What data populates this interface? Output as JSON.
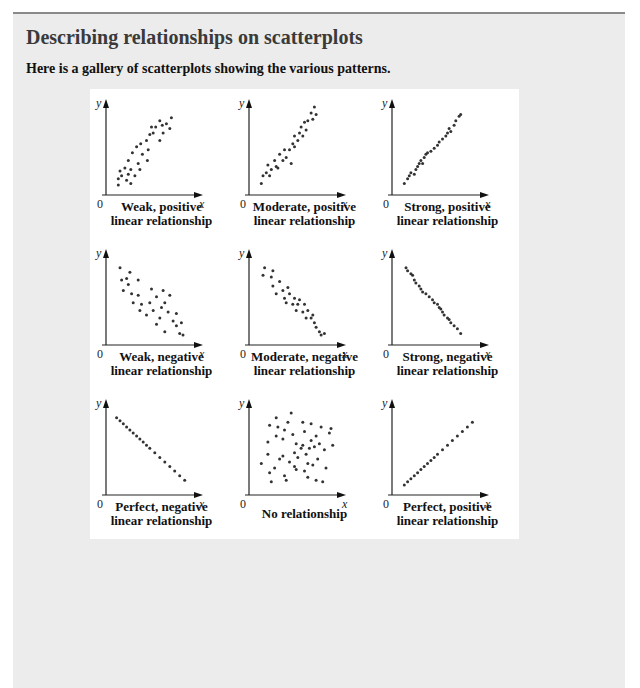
{
  "header": {
    "section_title": "Describing relationships on scatterplots",
    "intro": "Here is a gallery of scatterplots showing the various patterns."
  },
  "colors": {
    "panel_background": "#ececec",
    "gallery_background": "#ffffff",
    "point_color": "#333333",
    "top_rule": "#8a8a8a"
  },
  "axes": {
    "x_label": "x",
    "y_label": "y",
    "origin_label": "0"
  },
  "plots": [
    {
      "id": "weak-positive",
      "caption": [
        "Weak, positive",
        "linear relationship"
      ]
    },
    {
      "id": "moderate-positive",
      "caption": [
        "Moderate, positive",
        "linear relationship"
      ]
    },
    {
      "id": "strong-positive",
      "caption": [
        "Strong, positive",
        "linear relationship"
      ]
    },
    {
      "id": "weak-negative",
      "caption": [
        "Weak, negative",
        "linear relationship"
      ]
    },
    {
      "id": "moderate-negative",
      "caption": [
        "Moderate, negative",
        "linear relationship"
      ]
    },
    {
      "id": "strong-negative",
      "caption": [
        "Strong, negative",
        "linear relationship"
      ]
    },
    {
      "id": "perfect-negative",
      "caption": [
        "Perfect, negative",
        "linear relationship"
      ]
    },
    {
      "id": "no-relationship",
      "caption": [
        "No relationship"
      ]
    },
    {
      "id": "perfect-positive",
      "caption": [
        "Perfect, positive",
        "linear relationship"
      ]
    }
  ],
  "chart_data": [
    {
      "type": "scatter",
      "title": "Weak, positive linear relationship",
      "xlabel": "x",
      "ylabel": "y",
      "points": [
        [
          10,
          8
        ],
        [
          10,
          16
        ],
        [
          12,
          26
        ],
        [
          14,
          20
        ],
        [
          18,
          30
        ],
        [
          20,
          14
        ],
        [
          22,
          22
        ],
        [
          22,
          40
        ],
        [
          25,
          10
        ],
        [
          25,
          28
        ],
        [
          27,
          50
        ],
        [
          30,
          20
        ],
        [
          32,
          58
        ],
        [
          34,
          36
        ],
        [
          36,
          28
        ],
        [
          37,
          62
        ],
        [
          39,
          48
        ],
        [
          44,
          66
        ],
        [
          45,
          40
        ],
        [
          46,
          54
        ],
        [
          48,
          74
        ],
        [
          50,
          84
        ],
        [
          52,
          76
        ],
        [
          55,
          84
        ],
        [
          60,
          66
        ],
        [
          60,
          92
        ],
        [
          64,
          76
        ],
        [
          63,
          86
        ],
        [
          68,
          88
        ],
        [
          72,
          82
        ],
        [
          74,
          96
        ]
      ]
    },
    {
      "type": "scatter",
      "title": "Moderate, positive linear relationship",
      "xlabel": "x",
      "ylabel": "y",
      "points": [
        [
          10,
          10
        ],
        [
          12,
          20
        ],
        [
          16,
          24
        ],
        [
          18,
          34
        ],
        [
          20,
          20
        ],
        [
          22,
          28
        ],
        [
          26,
          40
        ],
        [
          28,
          32
        ],
        [
          30,
          30
        ],
        [
          32,
          48
        ],
        [
          36,
          40
        ],
        [
          38,
          54
        ],
        [
          40,
          44
        ],
        [
          44,
          54
        ],
        [
          46,
          36
        ],
        [
          48,
          62
        ],
        [
          50,
          58
        ],
        [
          50,
          72
        ],
        [
          54,
          66
        ],
        [
          56,
          76
        ],
        [
          58,
          84
        ],
        [
          60,
          72
        ],
        [
          62,
          90
        ],
        [
          64,
          80
        ],
        [
          66,
          92
        ],
        [
          70,
          102
        ],
        [
          72,
          94
        ],
        [
          76,
          100
        ],
        [
          74,
          110
        ]
      ]
    },
    {
      "type": "scatter",
      "title": "Strong, positive linear relationship",
      "xlabel": "x",
      "ylabel": "y",
      "points": [
        [
          10,
          10
        ],
        [
          14,
          16
        ],
        [
          16,
          20
        ],
        [
          18,
          24
        ],
        [
          22,
          22
        ],
        [
          24,
          28
        ],
        [
          26,
          32
        ],
        [
          28,
          36
        ],
        [
          30,
          40
        ],
        [
          32,
          36
        ],
        [
          34,
          44
        ],
        [
          36,
          48
        ],
        [
          38,
          50
        ],
        [
          42,
          52
        ],
        [
          46,
          56
        ],
        [
          50,
          60
        ],
        [
          52,
          64
        ],
        [
          56,
          68
        ],
        [
          60,
          72
        ],
        [
          62,
          76
        ],
        [
          64,
          82
        ],
        [
          66,
          78
        ],
        [
          70,
          86
        ],
        [
          72,
          92
        ],
        [
          76,
          98
        ],
        [
          78,
          100
        ]
      ]
    },
    {
      "type": "scatter",
      "title": "Weak, negative linear relationship",
      "xlabel": "x",
      "ylabel": "y",
      "points": [
        [
          12,
          96
        ],
        [
          14,
          80
        ],
        [
          16,
          66
        ],
        [
          20,
          82
        ],
        [
          22,
          74
        ],
        [
          24,
          90
        ],
        [
          26,
          62
        ],
        [
          28,
          50
        ],
        [
          34,
          60
        ],
        [
          34,
          80
        ],
        [
          36,
          40
        ],
        [
          38,
          48
        ],
        [
          44,
          34
        ],
        [
          48,
          50
        ],
        [
          50,
          68
        ],
        [
          52,
          40
        ],
        [
          56,
          58
        ],
        [
          56,
          22
        ],
        [
          60,
          30
        ],
        [
          62,
          44
        ],
        [
          64,
          66
        ],
        [
          66,
          12
        ],
        [
          66,
          50
        ],
        [
          70,
          38
        ],
        [
          72,
          60
        ],
        [
          76,
          26
        ],
        [
          80,
          20
        ],
        [
          80,
          36
        ],
        [
          84,
          10
        ],
        [
          86,
          24
        ],
        [
          88,
          8
        ]
      ]
    },
    {
      "type": "scatter",
      "title": "Moderate, negative linear relationship",
      "xlabel": "x",
      "ylabel": "y",
      "points": [
        [
          14,
          96
        ],
        [
          12,
          86
        ],
        [
          22,
          84
        ],
        [
          24,
          72
        ],
        [
          24,
          92
        ],
        [
          28,
          62
        ],
        [
          32,
          78
        ],
        [
          36,
          66
        ],
        [
          38,
          56
        ],
        [
          40,
          50
        ],
        [
          42,
          70
        ],
        [
          44,
          62
        ],
        [
          48,
          48
        ],
        [
          50,
          56
        ],
        [
          52,
          40
        ],
        [
          54,
          48
        ],
        [
          56,
          54
        ],
        [
          60,
          38
        ],
        [
          62,
          48
        ],
        [
          64,
          30
        ],
        [
          66,
          40
        ],
        [
          70,
          30
        ],
        [
          72,
          34
        ],
        [
          74,
          24
        ],
        [
          76,
          18
        ],
        [
          80,
          12
        ],
        [
          82,
          8
        ],
        [
          86,
          10
        ]
      ]
    },
    {
      "type": "scatter",
      "title": "Strong, negative linear relationship",
      "xlabel": "x",
      "ylabel": "y",
      "points": [
        [
          12,
          96
        ],
        [
          14,
          92
        ],
        [
          18,
          88
        ],
        [
          20,
          86
        ],
        [
          22,
          80
        ],
        [
          24,
          76
        ],
        [
          28,
          72
        ],
        [
          30,
          68
        ],
        [
          32,
          64
        ],
        [
          36,
          62
        ],
        [
          40,
          58
        ],
        [
          44,
          54
        ],
        [
          46,
          50
        ],
        [
          50,
          48
        ],
        [
          52,
          44
        ],
        [
          54,
          42
        ],
        [
          56,
          38
        ],
        [
          58,
          34
        ],
        [
          62,
          30
        ],
        [
          64,
          28
        ],
        [
          66,
          24
        ],
        [
          70,
          20
        ],
        [
          74,
          16
        ],
        [
          78,
          10
        ]
      ]
    },
    {
      "type": "scatter",
      "title": "Perfect, negative linear relationship",
      "xlabel": "x",
      "ylabel": "y",
      "points": [
        [
          8,
          96
        ],
        [
          12,
          92
        ],
        [
          16,
          88
        ],
        [
          20,
          84
        ],
        [
          24,
          80
        ],
        [
          28,
          76
        ],
        [
          32,
          72
        ],
        [
          36,
          68
        ],
        [
          40,
          64
        ],
        [
          44,
          60
        ],
        [
          48,
          56
        ],
        [
          54,
          50
        ],
        [
          60,
          44
        ],
        [
          66,
          38
        ],
        [
          72,
          32
        ],
        [
          78,
          26
        ],
        [
          84,
          20
        ],
        [
          90,
          14
        ]
      ]
    },
    {
      "type": "scatter",
      "title": "No relationship",
      "xlabel": "x",
      "ylabel": "y",
      "points": [
        [
          10,
          36
        ],
        [
          18,
          48
        ],
        [
          18,
          64
        ],
        [
          20,
          24
        ],
        [
          20,
          86
        ],
        [
          22,
          12
        ],
        [
          26,
          30
        ],
        [
          28,
          96
        ],
        [
          28,
          72
        ],
        [
          30,
          84
        ],
        [
          32,
          42
        ],
        [
          36,
          46
        ],
        [
          36,
          68
        ],
        [
          38,
          80
        ],
        [
          38,
          20
        ],
        [
          40,
          14
        ],
        [
          42,
          90
        ],
        [
          44,
          38
        ],
        [
          46,
          102
        ],
        [
          48,
          74
        ],
        [
          50,
          50
        ],
        [
          50,
          32
        ],
        [
          52,
          28
        ],
        [
          52,
          62
        ],
        [
          54,
          44
        ],
        [
          58,
          56
        ],
        [
          60,
          90
        ],
        [
          60,
          60
        ],
        [
          62,
          26
        ],
        [
          62,
          78
        ],
        [
          64,
          48
        ],
        [
          66,
          18
        ],
        [
          66,
          36
        ],
        [
          68,
          56
        ],
        [
          70,
          88
        ],
        [
          70,
          66
        ],
        [
          72,
          34
        ],
        [
          74,
          58
        ],
        [
          76,
          72
        ],
        [
          76,
          14
        ],
        [
          78,
          42
        ],
        [
          80,
          62
        ],
        [
          82,
          84
        ],
        [
          84,
          12
        ],
        [
          86,
          54
        ],
        [
          88,
          30
        ],
        [
          92,
          76
        ],
        [
          94,
          82
        ],
        [
          96,
          60
        ]
      ]
    },
    {
      "type": "scatter",
      "title": "Perfect, positive linear relationship",
      "xlabel": "x",
      "ylabel": "y",
      "points": [
        [
          10,
          8
        ],
        [
          14,
          12
        ],
        [
          18,
          16
        ],
        [
          22,
          20
        ],
        [
          26,
          24
        ],
        [
          30,
          28
        ],
        [
          34,
          32
        ],
        [
          38,
          36
        ],
        [
          42,
          40
        ],
        [
          46,
          44
        ],
        [
          50,
          48
        ],
        [
          56,
          54
        ],
        [
          62,
          60
        ],
        [
          68,
          66
        ],
        [
          74,
          72
        ],
        [
          80,
          78
        ],
        [
          86,
          84
        ],
        [
          92,
          90
        ]
      ]
    }
  ]
}
